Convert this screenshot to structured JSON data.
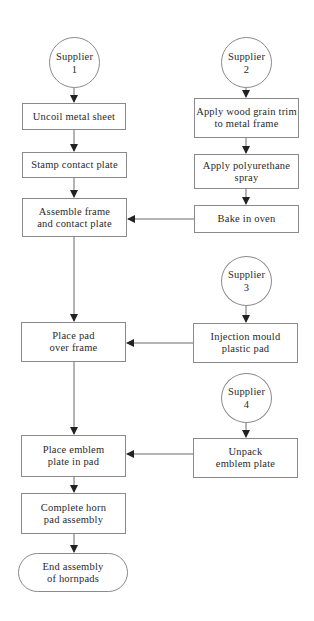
{
  "diagram": {
    "type": "flowchart",
    "suppliers": [
      {
        "id": "s1",
        "label": "Supplier\n1"
      },
      {
        "id": "s2",
        "label": "Supplier\n2"
      },
      {
        "id": "s3",
        "label": "Supplier\n3"
      },
      {
        "id": "s4",
        "label": "Supplier\n4"
      }
    ],
    "steps": {
      "uncoil": "Uncoil metal sheet",
      "stamp": "Stamp contact plate",
      "assemble": "Assemble frame\nand contact plate",
      "apply_trim": "Apply wood grain trim\nto metal frame",
      "apply_spray": "Apply polyurethane\nspray",
      "bake": "Bake in oven",
      "injection": "Injection mould\nplastic pad",
      "place_pad": "Place pad\nover frame",
      "unpack": "Unpack\nemblem plate",
      "place_emblem": "Place emblem\nplate in pad",
      "complete": "Complete horn\npad assembly",
      "end": "End assembly\nof hornpads"
    },
    "edges": [
      [
        "Supplier 1",
        "Uncoil metal sheet"
      ],
      [
        "Uncoil metal sheet",
        "Stamp contact plate"
      ],
      [
        "Stamp contact plate",
        "Assemble frame and contact plate"
      ],
      [
        "Supplier 2",
        "Apply wood grain trim to metal frame"
      ],
      [
        "Apply wood grain trim to metal frame",
        "Apply polyurethane spray"
      ],
      [
        "Apply polyurethane spray",
        "Bake in oven"
      ],
      [
        "Bake in oven",
        "Assemble frame and contact plate"
      ],
      [
        "Assemble frame and contact plate",
        "Place pad over frame"
      ],
      [
        "Supplier 3",
        "Injection mould plastic pad"
      ],
      [
        "Injection mould plastic pad",
        "Place pad over frame"
      ],
      [
        "Place pad over frame",
        "Place emblem plate in pad"
      ],
      [
        "Supplier 4",
        "Unpack emblem plate"
      ],
      [
        "Unpack emblem plate",
        "Place emblem plate in pad"
      ],
      [
        "Place emblem plate in pad",
        "Complete horn pad assembly"
      ],
      [
        "Complete horn pad assembly",
        "End assembly of hornpads"
      ]
    ]
  },
  "colors": {
    "line": "#6a6a6a",
    "border": "#8a8a8a",
    "text": "#2a2a2a",
    "background": "#ffffff"
  }
}
